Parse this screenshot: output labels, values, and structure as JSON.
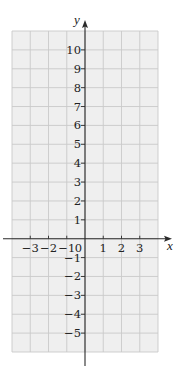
{
  "figure": {
    "x_axis": {
      "label": "x",
      "range": [
        -4,
        4
      ],
      "tick_labels": [
        "-3",
        "-2",
        "-1",
        "0",
        "1",
        "2",
        "3"
      ],
      "tick_values": [
        -3,
        -2,
        -1,
        0,
        1,
        2,
        3
      ]
    },
    "y_axis": {
      "label": "y",
      "range": [
        -6,
        11
      ],
      "tick_labels": [
        "10",
        "9",
        "8",
        "7",
        "6",
        "5",
        "4",
        "3",
        "2",
        "1",
        "-1",
        "-2",
        "-3",
        "-4",
        "-5"
      ],
      "tick_values": [
        10,
        9,
        8,
        7,
        6,
        5,
        4,
        3,
        2,
        1,
        -1,
        -2,
        -3,
        -4,
        -5
      ]
    },
    "grid": {
      "on": true,
      "step": 1
    },
    "colors": {
      "grid_background": "#efefef",
      "grid_line": "#c9c9c9",
      "axis": "#2a2a2a",
      "text": "#222222"
    }
  }
}
